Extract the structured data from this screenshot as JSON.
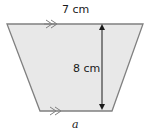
{
  "diagram": {
    "shape": "trapezoid",
    "fill_color": "#e8e8e8",
    "stroke_color": "#808080",
    "top_label": "7 cm",
    "height_label": "8 cm",
    "bottom_label": "a",
    "parallel_marks": "double-arrow"
  }
}
